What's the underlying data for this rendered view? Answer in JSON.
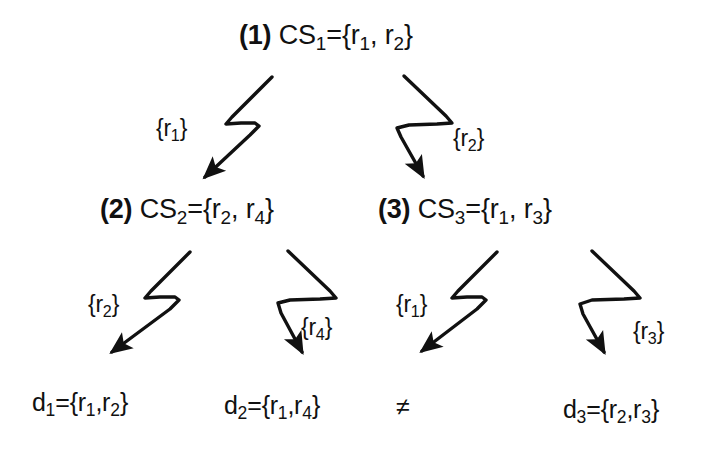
{
  "diagram": {
    "background_color": "#ffffff",
    "ink_color": "#111111",
    "nodes": [
      {
        "id": "cs1",
        "index_label": "(1)",
        "name": "CS",
        "name_sub": "1",
        "eq": "=",
        "set": "{r₁, r₂}",
        "set_plain": "{r1, r2}",
        "full_text": "(1) CS1={r1, r2}"
      },
      {
        "id": "cs2",
        "index_label": "(2)",
        "name": "CS",
        "name_sub": "2",
        "eq": "=",
        "set": "{r₂, r₄}",
        "set_plain": "{r2, r4}",
        "full_text": "(2) CS2={r2, r4}"
      },
      {
        "id": "cs3",
        "index_label": "(3)",
        "name": "CS",
        "name_sub": "3",
        "eq": "=",
        "set": "{r₁, r₃}",
        "set_plain": "{r1, r3}",
        "full_text": "(3) CS3={r1, r3}"
      }
    ],
    "leaves": [
      {
        "id": "d1",
        "name": "d",
        "name_sub": "1",
        "eq": "=",
        "set_plain": "{r1,r2}",
        "full_text": "d1={r1,r2}"
      },
      {
        "id": "d2",
        "name": "d",
        "name_sub": "2",
        "eq": "=",
        "set_plain": "{r1,r4}",
        "full_text": "d2={r1,r4}"
      },
      {
        "id": "d3",
        "name": "d",
        "name_sub": "3",
        "eq": "=",
        "set_plain": "{r2,r3}",
        "full_text": "d3={r2,r3}"
      }
    ],
    "relation_symbol": {
      "id": "not-equal",
      "glyph": "≠",
      "name": "not-equal-sign"
    },
    "edges": [
      {
        "id": "e1",
        "from": "cs1",
        "to": "cs2",
        "label_open": "{",
        "label_r": "r",
        "label_sub": "1",
        "label_close": "}",
        "label_plain": "{r1}",
        "direction": "down-left"
      },
      {
        "id": "e2",
        "from": "cs1",
        "to": "cs3",
        "label_open": "{",
        "label_r": "r",
        "label_sub": "2",
        "label_close": "}",
        "label_plain": "{r2}",
        "direction": "down-right"
      },
      {
        "id": "e3",
        "from": "cs2",
        "to": "d1",
        "label_open": "{",
        "label_r": "r",
        "label_sub": "2",
        "label_close": "}",
        "label_plain": "{r2}",
        "direction": "down-left"
      },
      {
        "id": "e4",
        "from": "cs2",
        "to": "d2",
        "label_open": "{",
        "label_r": "r",
        "label_sub": "4",
        "label_close": "}",
        "label_plain": "{r4}",
        "direction": "down-right"
      },
      {
        "id": "e5",
        "from": "cs3",
        "to": "neq",
        "label_open": "{",
        "label_r": "r",
        "label_sub": "1",
        "label_close": "}",
        "label_plain": "{r1}",
        "direction": "down-left"
      },
      {
        "id": "e6",
        "from": "cs3",
        "to": "d3",
        "label_open": "{",
        "label_r": "r",
        "label_sub": "3",
        "label_close": "}",
        "label_plain": "{r3}",
        "direction": "down-right"
      }
    ]
  }
}
